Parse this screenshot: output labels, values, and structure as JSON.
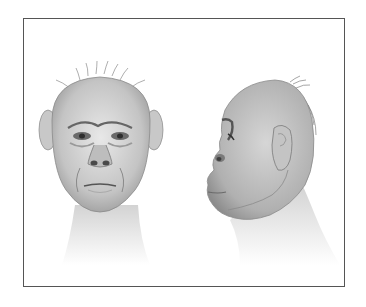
{
  "image": {
    "subject": "pencil illustration of hominid head reconstruction",
    "views": [
      {
        "name": "frontal-view"
      },
      {
        "name": "profile-view"
      }
    ],
    "colors": {
      "background": "#ffffff",
      "border": "#555555",
      "skin_light": "#d9d9d9",
      "skin_mid": "#b5b5b5",
      "skin_dark": "#7a7a7a"
    }
  }
}
